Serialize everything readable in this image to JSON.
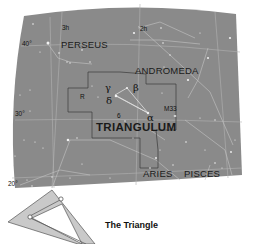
{
  "map": {
    "background": "#ffffff",
    "panel_color": "#8a8a8a",
    "grid_color": "#b4b4b4",
    "boundary_color": "#3a3a3a",
    "star_color": "#f2f2f2",
    "ra_labels": [
      {
        "text": "3h"
      },
      {
        "text": "2h"
      }
    ],
    "dec_labels": [
      {
        "text": "40°"
      },
      {
        "text": "30°"
      },
      {
        "text": "20°"
      }
    ],
    "constellations": [
      {
        "name": "PERSEUS"
      },
      {
        "name": "ANDROMEDA"
      },
      {
        "name": "TRIANGULUM"
      },
      {
        "name": "ARIES"
      },
      {
        "name": "PISCES"
      }
    ],
    "stars": {
      "gamma": "γ",
      "delta": "δ",
      "beta": "β",
      "alpha": "α",
      "six": "6",
      "r": "R"
    },
    "deep_sky": {
      "m33": "M33"
    }
  },
  "inset": {
    "fill_color": "#c9c9c9",
    "outline_color": "#555555",
    "caption": "The Triangle"
  }
}
